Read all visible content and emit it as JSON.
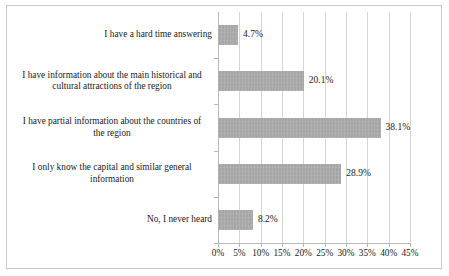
{
  "chart_data": {
    "type": "bar",
    "orientation": "horizontal",
    "title": "",
    "subtitle": "",
    "xlabel": "",
    "ylabel": "",
    "categories": [
      "I have a hard time answering",
      "I have information about the main historical and cultural attractions of the region",
      "I have partial information about the countries of the region",
      "I only know the capital and similar general information",
      "No, I never heard"
    ],
    "category_lines": [
      [
        "I have a hard time answering"
      ],
      [
        "I have information about the main historical and",
        "cultural attractions of the region"
      ],
      [
        "I have partial information about the countries of",
        "the region"
      ],
      [
        "I only know the capital and similar general",
        "information"
      ],
      [
        "No, I never heard"
      ]
    ],
    "values": [
      4.7,
      20.1,
      38.1,
      28.9,
      8.2
    ],
    "value_labels": [
      "4.7%",
      "20.1%",
      "38.1%",
      "28.9%",
      "8.2%"
    ],
    "xlim": [
      0,
      45
    ],
    "xticks": [
      0,
      5,
      10,
      15,
      20,
      25,
      30,
      35,
      40,
      45
    ],
    "xtick_labels": [
      "0%",
      "5%",
      "10%",
      "15%",
      "20%",
      "25%",
      "30%",
      "35%",
      "40%",
      "45%"
    ],
    "grid": "vertical",
    "legend": "none",
    "bar_color": "#a6a6a6",
    "gridline_color": "#d4d4d4",
    "axis_color": "#b8b8b8",
    "text_color": "#1a1a1a",
    "background": "#ffffff"
  }
}
